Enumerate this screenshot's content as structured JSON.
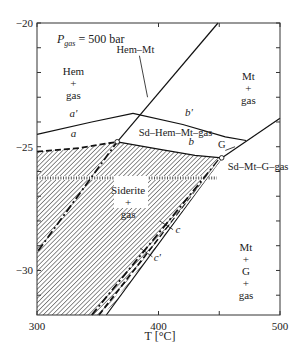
{
  "chart_data": {
    "type": "line",
    "subtitle": "P_gas = 500 bar",
    "pressure_label": {
      "p": "P",
      "sub": "gas",
      "rest": " = 500 bar"
    },
    "xlabel": "T [°C]",
    "ylabel": "",
    "xlim": [
      300,
      500
    ],
    "ylim": [
      -31.8,
      -20
    ],
    "xticks": [
      300,
      400,
      450,
      500
    ],
    "xtick_labels": [
      {
        "value": 300,
        "label": "300"
      },
      {
        "value": 400,
        "label": "400"
      },
      {
        "value": 500,
        "label": "500"
      }
    ],
    "yticks": [
      -20,
      -21,
      -22,
      -23,
      -24,
      -25,
      -26,
      -27,
      -28,
      -29,
      -30,
      -31
    ],
    "ytick_labels": [
      {
        "value": -20,
        "label": "−20"
      },
      {
        "value": -25,
        "label": "−25"
      },
      {
        "value": -30,
        "label": "−30"
      }
    ],
    "grid": false,
    "series": [
      {
        "name": "Hem-Mt",
        "style": "solid",
        "points": [
          [
            366,
            -24.8
          ],
          [
            449,
            -20
          ]
        ]
      },
      {
        "name": "Hem-Mt (metastable)",
        "style": "dashdot",
        "points": [
          [
            301,
            -29.2
          ],
          [
            366,
            -24.8
          ]
        ]
      },
      {
        "name": "a'",
        "style": "solid",
        "points": [
          [
            300,
            -24.5
          ],
          [
            345,
            -24.0
          ],
          [
            379,
            -23.65
          ]
        ]
      },
      {
        "name": "b'",
        "style": "solid",
        "points": [
          [
            379,
            -23.65
          ],
          [
            420,
            -24.1
          ],
          [
            455,
            -24.6
          ],
          [
            472,
            -24.75
          ]
        ]
      },
      {
        "name": "a",
        "style": "dashed",
        "points": [
          [
            300,
            -25.2
          ],
          [
            335,
            -25.05
          ],
          [
            366,
            -24.8
          ]
        ]
      },
      {
        "name": "b",
        "style": "solid",
        "points": [
          [
            366,
            -24.8
          ],
          [
            400,
            -25.1
          ],
          [
            430,
            -25.35
          ],
          [
            452,
            -25.45
          ]
        ]
      },
      {
        "name": "G",
        "style": "solid",
        "points": [
          [
            452,
            -25.45
          ],
          [
            500,
            -23.85
          ]
        ]
      },
      {
        "name": "c",
        "style": "dashed",
        "points": [
          [
            351,
            -31.8
          ],
          [
            452,
            -25.45
          ]
        ]
      },
      {
        "name": "c'",
        "style": "solid",
        "points": [
          [
            357,
            -31.8
          ],
          [
            452,
            -25.45
          ]
        ]
      },
      {
        "name": "inner dashed",
        "style": "dashdot",
        "points": [
          [
            345,
            -31.8
          ],
          [
            450,
            -25.5
          ]
        ]
      }
    ],
    "invariant_points": [
      {
        "name": "Sd-Hem-Mt-gas",
        "T": 366,
        "y": -24.8
      },
      {
        "name": "Sd-Mt-G-gas",
        "T": 452,
        "y": -25.45
      }
    ],
    "field_labels": [
      {
        "lines": [
          "Hem",
          "+",
          "gas"
        ],
        "T": 330,
        "y": -22.1
      },
      {
        "lines": [
          "Mt",
          "+",
          "gas"
        ],
        "T": 474,
        "y": -22.3
      },
      {
        "lines": [
          "Siderite",
          "+",
          "gas"
        ],
        "T": 375,
        "y": -26.9
      },
      {
        "lines": [
          "Mt",
          "+",
          "G",
          "+",
          "gas"
        ],
        "T": 472,
        "y": -29.2
      }
    ],
    "annotations": [
      {
        "text": "Hem–Mt",
        "T": 381,
        "y": -21.2
      },
      {
        "text": "Sd–Hem–Mt–gas",
        "T": 414,
        "y": -24.55
      },
      {
        "text": "Sd–Mt–G–gas",
        "T": 482,
        "y": -25.95
      },
      {
        "text": "G",
        "T": 452,
        "y": -25.05
      },
      {
        "text": "a'",
        "T": 330,
        "y": -23.8
      },
      {
        "text": "b'",
        "T": 425,
        "y": -23.75
      },
      {
        "text": "a",
        "T": 330,
        "y": -24.6
      },
      {
        "text": "b",
        "T": 427,
        "y": -24.95
      },
      {
        "text": "c",
        "T": 416,
        "y": -28.5
      },
      {
        "text": "c'",
        "T": 399,
        "y": -29.6
      }
    ],
    "shaded_region": {
      "name": "Siderite + gas stability field",
      "pattern": "diagonal-hatch"
    }
  }
}
